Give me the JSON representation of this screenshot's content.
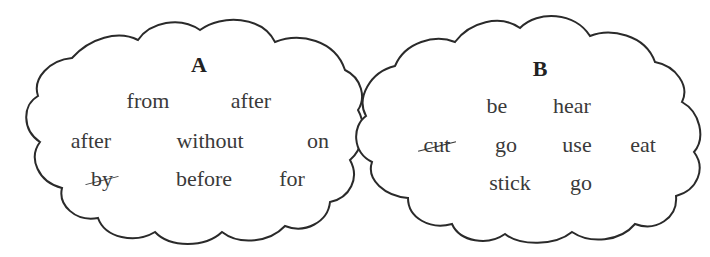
{
  "clouds": [
    {
      "title": "A",
      "rows": [
        [
          "from",
          "after"
        ],
        [
          "after",
          "without",
          "on"
        ],
        [
          "by",
          "before",
          "for"
        ]
      ],
      "crossed_out": [
        "by"
      ]
    },
    {
      "title": "B",
      "rows": [
        [
          "be",
          "hear"
        ],
        [
          "cut",
          "go",
          "use",
          "eat"
        ],
        [
          "stick",
          "go"
        ]
      ],
      "crossed_out": [
        "cut"
      ]
    }
  ],
  "a": {
    "title": "A",
    "r1": [
      "from",
      "after"
    ],
    "r2": [
      "after",
      "without",
      "on"
    ],
    "r3": [
      "by",
      "before",
      "for"
    ]
  },
  "b": {
    "title": "B",
    "r1": [
      "be",
      "hear"
    ],
    "r2": [
      "cut",
      "go",
      "use",
      "eat"
    ],
    "r3": [
      "stick",
      "go"
    ]
  }
}
